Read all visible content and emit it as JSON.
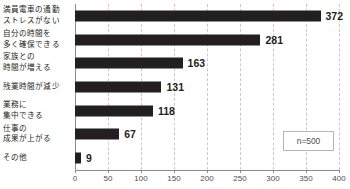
{
  "chart_data": {
    "type": "bar",
    "orientation": "horizontal",
    "title": "",
    "xlabel": "",
    "ylabel": "",
    "categories": [
      "満員電車の通勤ストレスがない",
      "自分の時間を多く確保できる",
      "家族との時間が増える",
      "残業時間が減少",
      "業務に集中できる",
      "仕事の成果が上がる",
      "その他"
    ],
    "category_lines": [
      [
        "満員電車の通勤",
        "ストレスがない"
      ],
      [
        "自分の時間を",
        "多く確保できる"
      ],
      [
        "家族との",
        "時間が増える"
      ],
      [
        "残業時間が減少"
      ],
      [
        "業務に",
        "集中できる"
      ],
      [
        "仕事の",
        "成果が上がる"
      ],
      [
        "その他"
      ]
    ],
    "values": [
      372,
      281,
      163,
      131,
      118,
      67,
      9
    ],
    "value_labels": [
      "372",
      "281",
      "163",
      "131",
      "118",
      "67",
      "9"
    ],
    "xlim": [
      0,
      400
    ],
    "xticks": [
      0,
      50,
      100,
      150,
      200,
      250,
      300,
      350,
      400
    ],
    "xtick_labels": [
      "0",
      "50",
      "100",
      "150",
      "200",
      "250",
      "300",
      "350",
      "400"
    ],
    "grid": true,
    "grid_style": "dashed-vertical",
    "legend": false,
    "bar_color": "#231f20",
    "grid_color": "#c9c9c9",
    "axis_color": "#8c8c8c",
    "text_color": "#231f20",
    "annotation": "n=500"
  },
  "annotation": {
    "sample_size_label": "n=500"
  }
}
